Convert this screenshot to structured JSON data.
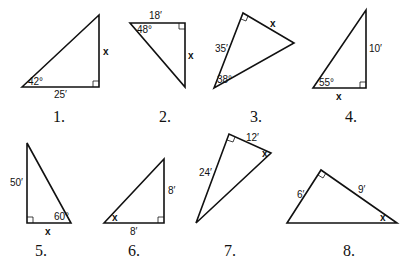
{
  "problems": [
    {
      "number": "1.",
      "angle": "42°",
      "side": "25′",
      "unknown": "x"
    },
    {
      "number": "2.",
      "angle": "48°",
      "side": "18′",
      "unknown": "x"
    },
    {
      "number": "3.",
      "angle": "38°",
      "side": "35′",
      "unknown": "x"
    },
    {
      "number": "4.",
      "angle": "55°",
      "side": "10′",
      "unknown": "x"
    },
    {
      "number": "5.",
      "angle": "60°",
      "side": "50′",
      "unknown": "x"
    },
    {
      "number": "6.",
      "side_a": "8′",
      "side_b": "8′",
      "unknown": "x"
    },
    {
      "number": "7.",
      "side_a": "24′",
      "side_b": "12′",
      "unknown": "x"
    },
    {
      "number": "8.",
      "side_a": "6′",
      "side_b": "9′",
      "unknown": "x"
    }
  ]
}
